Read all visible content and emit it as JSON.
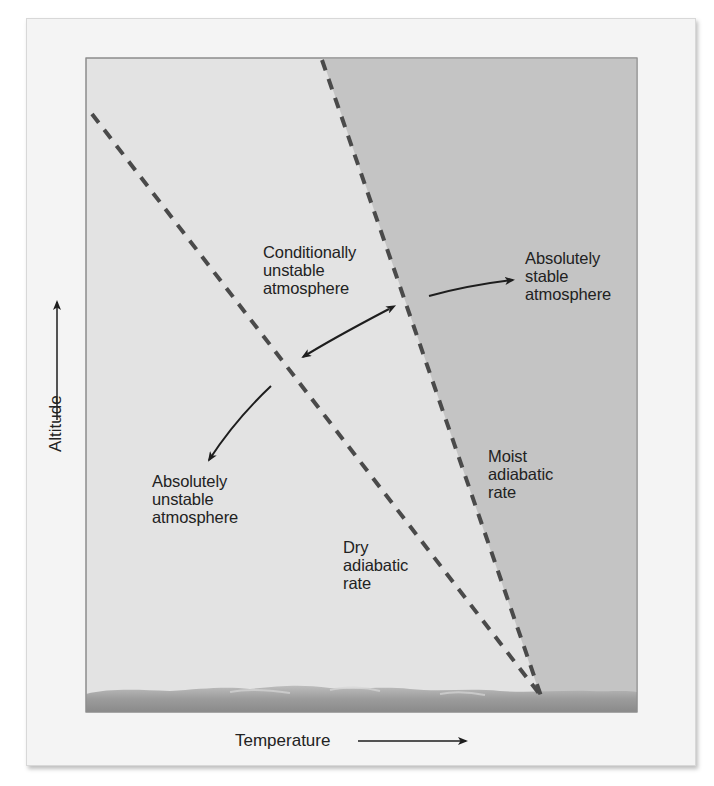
{
  "diagram": {
    "type": "atmospheric-stability-lapse-rate",
    "axes": {
      "x_label": "Temperature",
      "y_label": "Altitude"
    },
    "lines": [
      {
        "id": "dry-adiabatic",
        "label": "Dry adiabatic rate",
        "style": "dashed",
        "from": [
          92,
          114
        ],
        "to": [
          541,
          696
        ]
      },
      {
        "id": "moist-adiabatic",
        "label": "Moist adiabatic rate",
        "style": "dashed",
        "from": [
          322,
          58
        ],
        "to": [
          541,
          696
        ]
      }
    ],
    "regions": [
      {
        "id": "absolutely-unstable",
        "label": "Absolutely unstable atmosphere",
        "position": "left of dry adiabatic line"
      },
      {
        "id": "conditionally-unstable",
        "label": "Conditionally unstable atmosphere",
        "position": "between dry and moist adiabatic lines"
      },
      {
        "id": "absolutely-stable",
        "label": "Absolutely stable atmosphere",
        "position": "right of moist adiabatic line"
      }
    ],
    "colors": {
      "card": "#f4f4f4",
      "plot_light": "#e3e3e3",
      "plot_dark": "#c4c4c4",
      "dash": "#4a4a4a",
      "text": "#222222",
      "ground": "#9a9a9a"
    }
  },
  "labels": {
    "conditionally_unstable": "Conditionally\nunstable\natmosphere",
    "absolutely_stable": "Absolutely\nstable\natmosphere",
    "absolutely_unstable": "Absolutely\nunstable\natmosphere",
    "moist_adiabatic": "Moist\nadiabatic\nrate",
    "dry_adiabatic": "Dry\nadiabatic\nrate",
    "x_axis": "Temperature",
    "y_axis": "Altitude"
  }
}
